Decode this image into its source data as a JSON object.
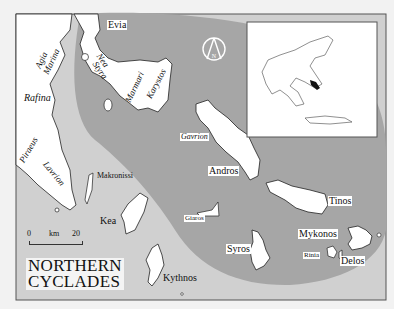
{
  "map": {
    "title_line1": "NORTHERN",
    "title_line2": "CYCLADES",
    "colors": {
      "page_background": "#f2f2f2",
      "sea_light": "#d0d0d0",
      "cyclades_zone_dark": "#a6a6a6",
      "land": "#ffffff",
      "coastline": "#222222",
      "frame": "#555555"
    },
    "scale_bar": {
      "start": "0",
      "unit": "km",
      "end": "20"
    },
    "compass": {
      "label": "N",
      "icon": "north-arrow-icon"
    },
    "inset": {
      "description": "Locator map of Greece with Northern Cyclades highlighted"
    },
    "labels": {
      "evia": "Evia",
      "agia_marina_1": "Agia",
      "agia_marina_2": "Marina",
      "nea_styra_1": "Nea",
      "nea_styra_2": "Styra",
      "marmari": "Marmari",
      "karystos": "Karystos",
      "rafina": "Rafina",
      "piraeus": "Piraeus",
      "lavrion": "Lavrion",
      "makronissi": "Makronissi",
      "kea": "Kea",
      "kythnos": "Kythnos",
      "gavrion": "Gavrion",
      "andros": "Andros",
      "giaros": "Giaros",
      "tinos": "Tinos",
      "syros": "Syros",
      "mykonos": "Mykonos",
      "rinia": "Rinia",
      "delos": "Delos"
    }
  }
}
